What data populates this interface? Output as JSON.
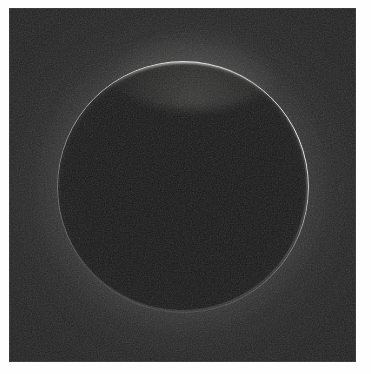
{
  "image": {
    "kind": "astronomical-photograph",
    "subject_label": "Backlit spherical body with bright atmospheric limb arc",
    "caption": "",
    "title": "",
    "frame": {
      "background_color": "#fefefe",
      "plate_left_px": 9,
      "plate_top_px": 8,
      "plate_width_px": 347,
      "plate_height_px": 354
    },
    "colors": {
      "sky_background": "#282828",
      "disk_interior": "#171717",
      "limb_highlight": "#ebebe6",
      "limb_peak": "#fffffc",
      "plate_border": "#787878"
    },
    "geometry": {
      "center_x_px": 182,
      "center_y_px": 186,
      "radius_px": 124,
      "limb_top_y_px": 62,
      "limb_bottom_y_px": 310,
      "limb_left_x_px": 58,
      "limb_right_x_px": 305,
      "ring_thickness_px": 2
    },
    "brightness": {
      "peak_azimuth_label": "top limb",
      "peak_position_x_px": 176,
      "peak_position_y_px": 62,
      "brightest_quadrant": "upper-right",
      "faintest_quadrant": "lower-left",
      "relative_peak": 1.0,
      "relative_upper_right": 0.85,
      "relative_upper_left": 0.6,
      "relative_right": 0.75,
      "relative_bottom": 0.25,
      "relative_lower_left": 0.1
    },
    "texture": {
      "grain": "film-grain-noise",
      "grain_opacity": 0.55
    }
  }
}
